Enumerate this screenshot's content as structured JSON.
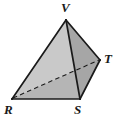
{
  "figure": {
    "name": "tetrahedron-diagram",
    "type": "geometric-solid",
    "solid": "tetrahedron",
    "background_color": "#ffffff",
    "stroke_color": "#1a1a1a",
    "labels": {
      "apex": "V",
      "right": "T",
      "bottom_left": "R",
      "bottom_right": "S"
    },
    "vertices": [
      {
        "id": "V",
        "label": "V",
        "x": 66,
        "y": 20,
        "label_x": 61,
        "label_y": 1
      },
      {
        "id": "T",
        "label": "T",
        "x": 100,
        "y": 60,
        "label_x": 104,
        "label_y": 52
      },
      {
        "id": "R",
        "label": "R",
        "x": 12,
        "y": 99,
        "label_x": 4,
        "label_y": 103
      },
      {
        "id": "S",
        "label": "S",
        "x": 80,
        "y": 99,
        "label_x": 74,
        "label_y": 103
      }
    ],
    "faces": [
      {
        "id": "VRS",
        "name": "face-front-left",
        "points": "66,20 12,99 80,99",
        "fill": "#c9c9c9"
      },
      {
        "id": "VST",
        "name": "face-front-right",
        "points": "66,20 80,99 100,60",
        "fill": "#a6a6a6"
      },
      {
        "id": "RST",
        "name": "face-bottom-hidden",
        "points": "12,99 80,99 100,60",
        "fill": "#b5b5b5"
      }
    ],
    "edges": [
      {
        "id": "VR",
        "name": "edge-V-R",
        "from": "V",
        "to": "R",
        "style": "solid"
      },
      {
        "id": "VS",
        "name": "edge-V-S",
        "from": "V",
        "to": "S",
        "style": "solid"
      },
      {
        "id": "VT",
        "name": "edge-V-T",
        "from": "V",
        "to": "T",
        "style": "solid"
      },
      {
        "id": "RS",
        "name": "edge-R-S",
        "from": "R",
        "to": "S",
        "style": "solid"
      },
      {
        "id": "ST",
        "name": "edge-S-T",
        "from": "S",
        "to": "T",
        "style": "solid"
      },
      {
        "id": "RT",
        "name": "edge-R-T-hidden",
        "from": "R",
        "to": "T",
        "style": "dashed"
      }
    ],
    "colors": {
      "face_light": "#c9c9c9",
      "face_medium": "#b5b5b5",
      "face_dark": "#a6a6a6",
      "stroke": "#1a1a1a",
      "label": "#1a1a1a",
      "background": "#ffffff"
    }
  }
}
